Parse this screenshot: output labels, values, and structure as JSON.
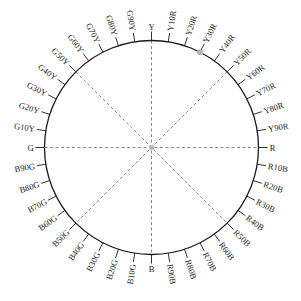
{
  "diagram": {
    "type": "hue-circle",
    "center": [
      151.5,
      147.5
    ],
    "radius": 107,
    "tick_length": 9,
    "label_radius": 118,
    "colors": {
      "circle": "#1a1a1a",
      "tick": "#1a1a1a",
      "dashed": "#666666",
      "marker": "#b5b5b5",
      "text": "#222222"
    },
    "hues": [
      "Y",
      "Y10R",
      "Y20R",
      "Y30R",
      "Y40R",
      "Y50R",
      "Y60R",
      "Y70R",
      "Y80R",
      "Y90R",
      "R",
      "R10B",
      "R20B",
      "R30B",
      "R40B",
      "R50B",
      "R60B",
      "R70B",
      "R80B",
      "R90B",
      "B",
      "B10G",
      "B20G",
      "B30G",
      "B40G",
      "B50G",
      "B60G",
      "B70G",
      "B80G",
      "B90G",
      "G",
      "G10Y",
      "G20Y",
      "G30Y",
      "G40Y",
      "G50Y",
      "G60Y",
      "G70Y",
      "G80Y",
      "G90Y"
    ],
    "dashed_axes": [
      [
        "Y",
        "B"
      ],
      [
        "G",
        "R"
      ],
      [
        "G50Y",
        "R50B"
      ],
      [
        "Y50R",
        "B50G"
      ]
    ],
    "marker": {
      "hue": "Y30R",
      "label": "marker-dot"
    }
  }
}
